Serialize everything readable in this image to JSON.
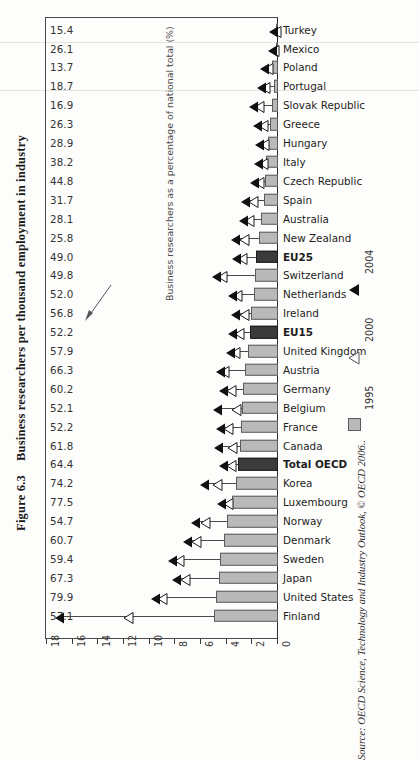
{
  "figure": {
    "number": "Figure 6.3",
    "title": "Business researchers per thousand employment in industry",
    "source": "Source: OECD Science, Technology and Industry Outlook, © OECD 2006..",
    "annotation": "Business researchers as a percentage of national total (%)"
  },
  "legend": {
    "items": [
      {
        "label": "2004",
        "marker": "solid-triangle-icon",
        "color": "#111111"
      },
      {
        "label": "2000",
        "marker": "hollow-triangle-icon",
        "color": "#ffffff"
      },
      {
        "label": "1995",
        "marker": "gray-square-icon",
        "color": "#b9b9b9"
      }
    ]
  },
  "chart_data": {
    "type": "bar",
    "title": "Business researchers per thousand employment in industry",
    "xlabel": "Business researchers per thousand employment in industry",
    "ylabel": "",
    "xlim": [
      18,
      0
    ],
    "x_reversed": true,
    "xticks": [
      18,
      16,
      14,
      12,
      10,
      8,
      6,
      4,
      2,
      0
    ],
    "grid": false,
    "legend_position": "right",
    "annotation": "Business researchers as a percentage of national total (%)",
    "value_column_header": "Business researchers as a percentage of national total (%)",
    "categories": [
      "Turkey",
      "Mexico",
      "Poland",
      "Portugal",
      "Slovak Republic",
      "Greece",
      "Hungary",
      "Italy",
      "Czech Republic",
      "Spain",
      "Australia",
      "New Zealand",
      "EU25",
      "Switzerland",
      "Netherlands",
      "Ireland",
      "EU15",
      "United Kingdom",
      "Austria",
      "Germany",
      "Belgium",
      "France",
      "Canada",
      "Total OECD",
      "Korea",
      "Luxembourg",
      "Norway",
      "Denmark",
      "Sweden",
      "Japan",
      "United States",
      "Finland"
    ],
    "highlighted_categories": [
      "EU25",
      "EU15",
      "Total OECD"
    ],
    "series": [
      {
        "name": "1995",
        "marker": "gray-square-icon",
        "values": [
          0.0,
          0.15,
          0.5,
          0.3,
          0.5,
          0.6,
          0.8,
          0.9,
          1.0,
          1.1,
          1.3,
          1.5,
          1.7,
          1.8,
          1.9,
          2.1,
          2.2,
          2.3,
          2.6,
          2.7,
          2.8,
          2.9,
          3.0,
          3.1,
          3.3,
          3.6,
          4.0,
          4.2,
          4.5,
          4.6,
          4.8,
          5.0
        ]
      },
      {
        "name": "2000",
        "marker": "hollow-triangle-icon",
        "values": [
          0.1,
          0.2,
          0.7,
          0.9,
          1.4,
          1.1,
          1.0,
          1.1,
          1.4,
          1.9,
          2.2,
          2.6,
          2.7,
          4.3,
          3.1,
          2.6,
          3.0,
          3.3,
          4.1,
          3.6,
          3.2,
          3.8,
          3.5,
          3.6,
          4.7,
          3.8,
          5.6,
          6.3,
          7.6,
          7.2,
          9.0,
          11.6
        ]
      },
      {
        "name": "2004",
        "marker": "solid-triangle-icon",
        "values": [
          0.2,
          0.3,
          0.9,
          1.2,
          1.8,
          1.5,
          1.3,
          1.4,
          1.7,
          2.4,
          2.6,
          3.2,
          3.1,
          4.7,
          3.4,
          3.2,
          3.4,
          3.6,
          4.4,
          4.1,
          4.6,
          4.4,
          4.5,
          4.1,
          5.6,
          4.3,
          6.3,
          6.9,
          8.1,
          7.8,
          9.4,
          16.9
        ]
      }
    ],
    "value_labels": [
      "15.4",
      "26.1",
      "13.7",
      "18.7",
      "16.9",
      "26.3",
      "28.9",
      "38.2",
      "44.8",
      "31.7",
      "28.1",
      "25.8",
      "49.0",
      "49.8",
      "52.0",
      "56.8",
      "52.2",
      "57.9",
      "66.3",
      "60.2",
      "52.1",
      "52.2",
      "61.8",
      "64.4",
      "74.2",
      "77.5",
      "54.7",
      "60.7",
      "59.4",
      "67.3",
      "79.9",
      "57.1"
    ]
  }
}
